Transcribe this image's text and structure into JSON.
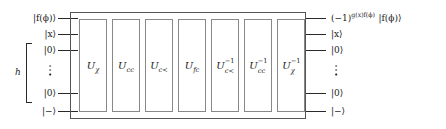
{
  "figure": {
    "type": "quantum-circuit-diagram"
  },
  "inputs": [
    {
      "id": "in-0",
      "label": "|f(ϕ)⟩",
      "kind": "ket"
    },
    {
      "id": "in-1",
      "label": "|x⟩",
      "kind": "ket"
    },
    {
      "id": "in-2",
      "label": "|0⟩",
      "kind": "ket"
    },
    {
      "id": "in-dots",
      "label": "⋮",
      "kind": "vdots"
    },
    {
      "id": "in-3",
      "label": "|0⟩",
      "kind": "ket"
    },
    {
      "id": "in-4",
      "label": "|−⟩",
      "kind": "ket"
    }
  ],
  "outputs": [
    {
      "id": "out-0",
      "label": "(−1)",
      "exponent": "g(x)f(ϕ)",
      "tail": "|f(ϕ)⟩",
      "kind": "phase-ket"
    },
    {
      "id": "out-1",
      "label": "|x⟩",
      "kind": "ket"
    },
    {
      "id": "out-2",
      "label": "|0⟩",
      "kind": "ket"
    },
    {
      "id": "out-dots",
      "label": "⋮",
      "kind": "vdots"
    },
    {
      "id": "out-3",
      "label": "|0⟩",
      "kind": "ket"
    },
    {
      "id": "out-4",
      "label": "|−⟩",
      "kind": "ket"
    }
  ],
  "register": {
    "brace_label": "h",
    "spans_inputs": [
      "in-2",
      "in-3"
    ]
  },
  "gates": [
    {
      "id": "gate-1",
      "base": "U",
      "sub": "χ",
      "sup": "",
      "name": "u-chi"
    },
    {
      "id": "gate-2",
      "base": "U",
      "sub": "cc",
      "sup": "",
      "name": "u-cc"
    },
    {
      "id": "gate-3",
      "base": "U",
      "sub": "c<",
      "sup": "",
      "name": "u-c-lt"
    },
    {
      "id": "gate-4",
      "base": "U",
      "sub": "fc",
      "sup": "",
      "name": "u-fc"
    },
    {
      "id": "gate-5",
      "base": "U",
      "sub": "c<",
      "sup": "−1",
      "name": "u-c-lt-inverse"
    },
    {
      "id": "gate-6",
      "base": "U",
      "sub": "cc",
      "sup": "−1",
      "name": "u-cc-inverse"
    },
    {
      "id": "gate-7",
      "base": "U",
      "sub": "χ",
      "sup": "−1",
      "name": "u-chi-inverse"
    }
  ],
  "colors": {
    "wire": "#2a2a2a",
    "outer_box_border": "#555555",
    "gate_border": "#888888",
    "text": "#1a1a1a",
    "background": "#ffffff"
  }
}
